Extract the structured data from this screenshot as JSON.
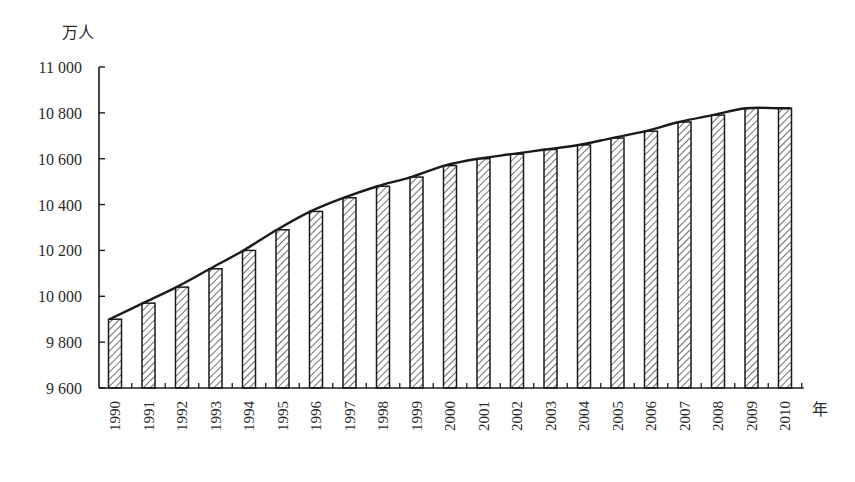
{
  "chart_data": {
    "type": "bar",
    "title": "",
    "xlabel": "年",
    "ylabel": "万人",
    "ylim": [
      9600,
      11000
    ],
    "yticks": [
      9600,
      9800,
      10000,
      10200,
      10400,
      10600,
      10800,
      11000
    ],
    "ytick_labels": [
      "9 600",
      "9 800",
      "10 000",
      "10 200",
      "10 400",
      "10 600",
      "10 800",
      "11 000"
    ],
    "grid": false,
    "legend": null,
    "bar_pattern": "diagonal-hatch",
    "overlay": "smoothed trend line through bar tops",
    "categories": [
      "1990",
      "1991",
      "1992",
      "1993",
      "1994",
      "1995",
      "1996",
      "1997",
      "1998",
      "1999",
      "2000",
      "2001",
      "2002",
      "2003",
      "2004",
      "2005",
      "2006",
      "2007",
      "2008",
      "2009",
      "2010"
    ],
    "values": [
      9900,
      9970,
      10040,
      10120,
      10200,
      10290,
      10370,
      10430,
      10480,
      10520,
      10570,
      10600,
      10620,
      10640,
      10660,
      10690,
      10720,
      10760,
      10790,
      10820,
      10820
    ]
  },
  "colors": {
    "axis": "#1a1a1a",
    "bar_stroke": "#1a1a1a",
    "hatch": "#333333",
    "line": "#1a1a1a",
    "background": "#ffffff"
  }
}
